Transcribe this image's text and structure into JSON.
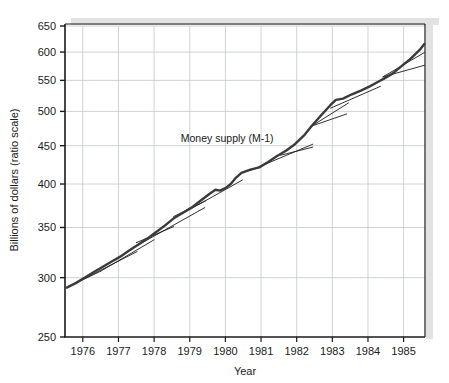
{
  "chart_data": {
    "type": "line",
    "title": "",
    "annotation": "Money supply (M-1)",
    "xlabel": "Year",
    "ylabel": "Billions of dollars (ratio scale)",
    "yscale": "log",
    "ylim": [
      250,
      650
    ],
    "xlim": [
      1975.5,
      1985.6
    ],
    "grid": true,
    "legend_position": "none",
    "yticks": [
      250,
      300,
      350,
      400,
      450,
      500,
      550,
      600,
      650
    ],
    "ytick_labels": [
      "250",
      "300",
      "350",
      "400",
      "450",
      "500",
      "550",
      "600",
      "650"
    ],
    "xticks": [
      1976,
      1977,
      1978,
      1979,
      1980,
      1981,
      1982,
      1983,
      1984,
      1985
    ],
    "xtick_labels": [
      "1976",
      "1977",
      "1978",
      "1979",
      "1980",
      "1981",
      "1982",
      "1983",
      "1984",
      "1985"
    ],
    "series": [
      {
        "name": "Money supply (M-1)",
        "color": "#3a3a3a",
        "width": 2.4,
        "x": [
          1975.55,
          1975.8,
          1976.05,
          1976.3,
          1976.55,
          1976.8,
          1977.05,
          1977.3,
          1977.55,
          1977.8,
          1978.05,
          1978.3,
          1978.55,
          1978.8,
          1979.05,
          1979.3,
          1979.55,
          1979.72,
          1979.85,
          1980.0,
          1980.15,
          1980.3,
          1980.45,
          1980.7,
          1980.95,
          1981.2,
          1981.45,
          1981.7,
          1981.95,
          1982.2,
          1982.42,
          1982.7,
          1982.95,
          1983.1,
          1983.3,
          1983.55,
          1983.8,
          1984.05,
          1984.3,
          1984.45,
          1984.7,
          1984.95,
          1985.2,
          1985.45,
          1985.58
        ],
        "values": [
          291,
          295,
          300,
          305,
          310,
          315,
          320,
          326,
          332,
          338,
          345,
          352,
          360,
          366,
          372,
          380,
          388,
          393,
          392,
          395,
          400,
          408,
          414,
          418,
          421,
          428,
          436,
          443,
          452,
          464,
          478,
          495,
          510,
          518,
          520,
          527,
          533,
          540,
          548,
          553,
          562,
          575,
          588,
          604,
          615
        ]
      }
    ],
    "trend_lines": [
      {
        "name": "trend-1976",
        "x": [
          1975.55,
          1976.5
        ],
        "values": [
          291,
          306
        ],
        "color": "#1a1a1a",
        "width": 0.9
      },
      {
        "name": "trend-1976-b",
        "x": [
          1975.55,
          1977.52
        ],
        "values": [
          291,
          325
        ],
        "color": "#1a1a1a",
        "width": 0.9
      },
      {
        "name": "trend-1977",
        "x": [
          1976.5,
          1978.0
        ],
        "values": [
          306,
          337
        ],
        "color": "#1a1a1a",
        "width": 0.9
      },
      {
        "name": "trend-1977-flat",
        "x": [
          1977.5,
          1978.55
        ],
        "values": [
          334,
          351
        ],
        "color": "#1a1a1a",
        "width": 0.9
      },
      {
        "name": "trend-1978",
        "x": [
          1977.52,
          1979.42
        ],
        "values": [
          331,
          372
        ],
        "color": "#1a1a1a",
        "width": 0.9
      },
      {
        "name": "trend-1978-b",
        "x": [
          1978.55,
          1979.45
        ],
        "values": [
          362,
          380
        ],
        "color": "#1a1a1a",
        "width": 0.9
      },
      {
        "name": "trend-1979",
        "x": [
          1979.05,
          1980.48
        ],
        "values": [
          371,
          405
        ],
        "color": "#1a1a1a",
        "width": 0.9
      },
      {
        "name": "trend-1981",
        "x": [
          1980.7,
          1982.45
        ],
        "values": [
          417,
          452
        ],
        "color": "#1a1a1a",
        "width": 0.9
      },
      {
        "name": "trend-1981-b",
        "x": [
          1981.55,
          1982.45
        ],
        "values": [
          437,
          448
        ],
        "color": "#1a1a1a",
        "width": 0.9
      },
      {
        "name": "trend-1982",
        "x": [
          1982.42,
          1983.4
        ],
        "values": [
          478,
          496
        ],
        "color": "#1a1a1a",
        "width": 0.9
      },
      {
        "name": "trend-1982-b",
        "x": [
          1982.42,
          1983.45
        ],
        "values": [
          478,
          513
        ],
        "color": "#1a1a1a",
        "width": 0.9
      },
      {
        "name": "trend-1983",
        "x": [
          1982.95,
          1984.35
        ],
        "values": [
          505,
          540
        ],
        "color": "#1a1a1a",
        "width": 0.9
      },
      {
        "name": "trend-1984",
        "x": [
          1984.42,
          1985.58
        ],
        "values": [
          556,
          576
        ],
        "color": "#1a1a1a",
        "width": 0.9
      },
      {
        "name": "trend-1984-b",
        "x": [
          1984.42,
          1985.58
        ],
        "values": [
          556,
          599
        ],
        "color": "#1a1a1a",
        "width": 0.9
      }
    ],
    "annotation_position": {
      "x": 1980.05,
      "y": 455
    },
    "colors": {
      "series": "#3a3a3a",
      "trend": "#1a1a1a",
      "grid": "#c8cdd2",
      "axis": "#1a1a1a",
      "shadow": "#e2e2e2",
      "background": "#ffffff"
    }
  }
}
